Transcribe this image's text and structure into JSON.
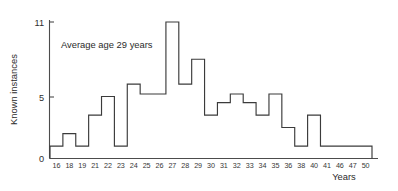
{
  "chart_data": {
    "type": "bar",
    "title": "",
    "subtitle": "",
    "xlabel": "Years",
    "ylabel": "Known instances",
    "categories": [
      "16",
      "18",
      "19",
      "21",
      "22",
      "23",
      "24",
      "25",
      "26",
      "27",
      "28",
      "29",
      "30",
      "31",
      "32",
      "33",
      "34",
      "35",
      "36",
      "38",
      "40",
      "41",
      "46",
      "47",
      "50"
    ],
    "values": [
      1,
      2,
      1,
      3.5,
      5,
      1,
      6,
      5.2,
      5.2,
      11,
      6,
      8,
      3.5,
      4.5,
      5.2,
      4.5,
      3.5,
      5.2,
      2.5,
      1,
      3.5,
      1,
      1,
      1,
      1
    ],
    "ylim": [
      0,
      11.6
    ],
    "yticks": [
      0,
      5,
      11
    ],
    "ytick_labels": [
      "0",
      "5",
      "11"
    ],
    "grid": false,
    "legend": null,
    "legend_position": "none",
    "style": "step-outline-histogram",
    "annotations": [
      {
        "text": "Average age 29 years",
        "x_category": "19",
        "y_value": 9.2
      }
    ]
  },
  "axes": {
    "y_axis_title": "Known instances",
    "x_axis_title": "Years",
    "y_tick_values": [
      "0",
      "5",
      "11"
    ]
  },
  "annotation": {
    "average_age_note": "Average age 29 years"
  },
  "colors": {
    "plot_line": "#3b3b3b",
    "axis": "#4c4c4c",
    "text": "#2b2b2b",
    "background": "#ffffff"
  }
}
